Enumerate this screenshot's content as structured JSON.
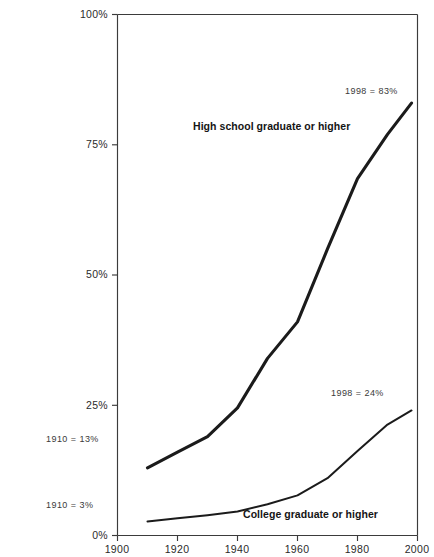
{
  "chart_data": {
    "type": "line",
    "title": "",
    "xlabel": "",
    "ylabel": "",
    "xlim": [
      1900,
      2000
    ],
    "ylim": [
      0,
      100
    ],
    "grid": false,
    "legend_position": "inline-annotations",
    "x_ticks": [
      "1900",
      "1920",
      "1940",
      "1960",
      "1980",
      "2000"
    ],
    "x_tick_values": [
      1900,
      1920,
      1940,
      1960,
      1980,
      2000
    ],
    "y_ticks": [
      "0%",
      "25%",
      "50%",
      "75%",
      "100%"
    ],
    "y_tick_values": [
      0,
      25,
      50,
      75,
      100
    ],
    "x": [
      1910,
      1920,
      1930,
      1940,
      1950,
      1960,
      1970,
      1980,
      1990,
      1998
    ],
    "series": [
      {
        "name": "High school graduate or higher",
        "values": [
          13.0,
          16.0,
          19.0,
          24.5,
          34.0,
          41.0,
          55.0,
          68.5,
          77.0,
          83.0
        ]
      },
      {
        "name": "College graduate or higher",
        "values": [
          2.7,
          3.3,
          3.9,
          4.6,
          6.0,
          7.7,
          11.0,
          16.2,
          21.3,
          24.0
        ]
      }
    ],
    "annotations": [
      {
        "text": "1910 = 13%",
        "series": "High school graduate or higher",
        "x": 1910,
        "y": 13
      },
      {
        "text": "1998 = 83%",
        "series": "High school graduate or higher",
        "x": 1998,
        "y": 83
      },
      {
        "text": "1910 = 3%",
        "series": "College graduate or higher",
        "x": 1910,
        "y": 3
      },
      {
        "text": "1998 = 24%",
        "series": "College graduate or higher",
        "x": 1998,
        "y": 24
      }
    ]
  },
  "axis": {
    "y_labels": [
      "100%",
      "75%",
      "50%",
      "25%",
      "0%"
    ],
    "x_labels": [
      "1900",
      "1920",
      "1940",
      "1960",
      "1980",
      "2000"
    ]
  },
  "series_labels": {
    "high_school": "High school graduate or higher",
    "college": "College graduate or higher"
  },
  "annotations": {
    "hs_start": "1910 = 13%",
    "hs_end": "1998 = 83%",
    "col_start": "1910 = 3%",
    "col_end": "1998 = 24%"
  },
  "colors": {
    "line": "#1b1b1b",
    "axis": "#3b3b3b",
    "text": "#231f20",
    "background": "#ffffff"
  }
}
